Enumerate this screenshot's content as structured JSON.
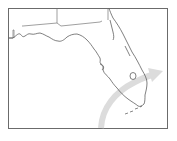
{
  "map": {
    "region": "Florida",
    "frame_color": "#6b6b6b",
    "outline_color": "#555555",
    "arrow_color": "#d9d9d9",
    "background": "#ffffff"
  }
}
